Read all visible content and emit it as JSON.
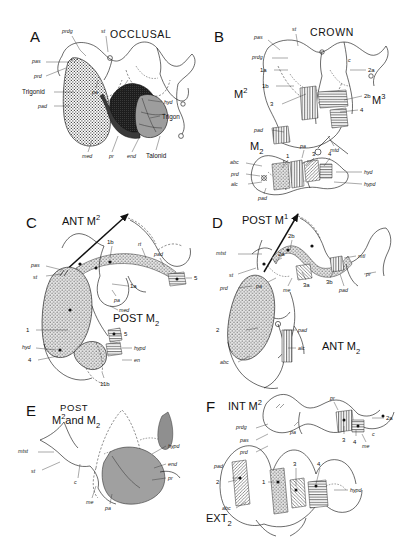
{
  "figure": {
    "width": 401,
    "height": 550,
    "type": "anatomical-line-drawing",
    "panel_count": 6
  },
  "panels": [
    {
      "letter": "A",
      "title": "OCCLUSAL",
      "tooth_titles": [],
      "labels": [
        "prdg",
        "st",
        "pas",
        "prd",
        "Trigonid",
        "pad",
        "pa",
        "me",
        "hyd",
        "Trigon",
        "med",
        "pr",
        "end",
        "Talonid"
      ],
      "numbers": []
    },
    {
      "letter": "B",
      "title": "CROWN",
      "tooth_titles": [
        "M",
        "2",
        "M",
        "3",
        "M",
        "2"
      ],
      "labels": [
        "pas",
        "st",
        "prdg",
        "pad",
        "mtd",
        "c",
        "abc",
        "prd",
        "alc",
        "pad",
        "pa",
        "hyd",
        "hypd"
      ],
      "numbers": [
        "1a",
        "1b",
        "2a",
        "2b",
        "3",
        "4",
        "1",
        "3",
        "4"
      ]
    },
    {
      "letter": "C",
      "title": "",
      "tooth_titles": [
        "ANT M",
        "2",
        "POST M",
        "2"
      ],
      "labels": [
        "pas",
        "st",
        "pa",
        "med",
        "rt",
        "pad",
        "hyd",
        "hypd",
        "en"
      ],
      "numbers": [
        "1a",
        "1b",
        "5",
        "1",
        "4",
        "5",
        "11b"
      ]
    },
    {
      "letter": "D",
      "title": "",
      "tooth_titles": [
        "POST M",
        "1",
        "ANT M",
        "2"
      ],
      "labels": [
        "mtst",
        "st",
        "prd",
        "pa",
        "me",
        "mtl",
        "pr",
        "pad",
        "pad",
        "alc",
        "abc"
      ],
      "numbers": [
        "2a",
        "2b",
        "3a",
        "3b",
        "2"
      ]
    },
    {
      "letter": "E",
      "title": "POST",
      "tooth_titles": [
        "M",
        "2",
        "and M",
        "2"
      ],
      "labels": [
        "mtst",
        "st",
        "c",
        "me",
        "pa",
        "hypd",
        "end",
        "pr"
      ],
      "numbers": []
    },
    {
      "letter": "F",
      "title": "",
      "tooth_titles": [
        "INT M",
        "2",
        "EXT",
        "2"
      ],
      "labels": [
        "prdg",
        "pas",
        "prd",
        "pad",
        "abc",
        "pa",
        "pr",
        "me",
        "c",
        "hypd"
      ],
      "numbers": [
        "2",
        "2a",
        "3",
        "4",
        "3",
        "4",
        "1"
      ]
    }
  ],
  "legend_terms": {
    "trigonid": "Trigonid",
    "trigon": "Trigon",
    "talonid": "Talonid"
  },
  "colors": {
    "ink": "#111111",
    "stipple_fill": "#d8d8d8",
    "dark_fill": "#2a2a2a",
    "gray_fill": "#9a9a9a",
    "hatch": "#555555",
    "paper": "#ffffff"
  }
}
